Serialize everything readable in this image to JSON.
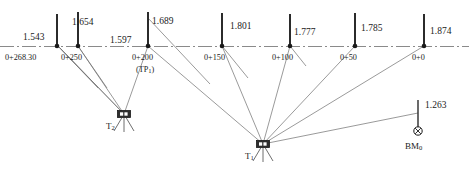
{
  "figure": {
    "ground_line_style": "dash-dot centerline",
    "colors": {
      "ink": "#1a1a1a",
      "rod": "#2b2b2b",
      "sight_line": "#6e6e6e",
      "ground_line": "#8a8a8a",
      "background": "#ffffff"
    }
  },
  "ghost_text": "",
  "instruments": [
    {
      "id": "T2",
      "label": "T",
      "sub": "2",
      "icon": "theodolite-icon",
      "x": 124,
      "y": 114
    },
    {
      "id": "T1",
      "label": "T",
      "sub": "1",
      "icon": "theodolite-icon",
      "x": 263,
      "y": 144
    }
  ],
  "stations": [
    {
      "id": "sta-268",
      "station": "0+268.30",
      "reading": "1.543",
      "x": 57,
      "reading_x": 23,
      "reading_y": 33,
      "station_x": 5,
      "rod_top": 14,
      "is_tp": false,
      "sighted_by": "T2"
    },
    {
      "id": "sta-250",
      "station": "0+250",
      "reading": "1.654",
      "x": 78,
      "reading_x": 72,
      "reading_y": 18,
      "station_x": 61,
      "rod_top": 12,
      "is_tp": false,
      "sighted_by": "T2"
    },
    {
      "id": "sta-200",
      "station": "0+200",
      "reading": "1.597",
      "reading2": "1.689",
      "x": 148,
      "reading_x": 110,
      "reading_y": 36,
      "reading2_x": 152,
      "reading2_y": 17,
      "station_x": 132,
      "tp_text": "(TP",
      "tp_sub": "1",
      "tp_close": ")",
      "tp_x": 136,
      "rod_top": 12,
      "is_tp": true,
      "sighted_by": "T2 and T1"
    },
    {
      "id": "sta-150",
      "station": "0+150",
      "reading": "1.801",
      "x": 222,
      "reading_x": 230,
      "reading_y": 22,
      "station_x": 204,
      "rod_top": 13,
      "is_tp": false,
      "sighted_by": "T1"
    },
    {
      "id": "sta-100",
      "station": "0+100",
      "reading": "1.777",
      "x": 290,
      "reading_x": 294,
      "reading_y": 28,
      "station_x": 272,
      "rod_top": 14,
      "is_tp": false,
      "sighted_by": "T1"
    },
    {
      "id": "sta-50",
      "station": "0+50",
      "reading": "1.785",
      "x": 355,
      "reading_x": 361,
      "reading_y": 24,
      "station_x": 340,
      "rod_top": 13,
      "is_tp": false,
      "sighted_by": "T1"
    },
    {
      "id": "sta-0",
      "station": "0+0",
      "reading": "1.874",
      "x": 424,
      "reading_x": 430,
      "reading_y": 27,
      "station_x": 412,
      "rod_top": 14,
      "is_tp": false,
      "sighted_by": "T1"
    }
  ],
  "benchmark": {
    "id": "BM0",
    "label": "BM",
    "sub": "0",
    "reading": "1.263",
    "icon": "benchmark-icon",
    "x": 418,
    "y": 131,
    "rod_top": 100,
    "reading_x": 425,
    "reading_y": 101,
    "label_x": 405,
    "label_y": 142,
    "sighted_by": "T1"
  },
  "ground_line": {
    "y": 46,
    "x_start": 0,
    "x_end": 469
  }
}
